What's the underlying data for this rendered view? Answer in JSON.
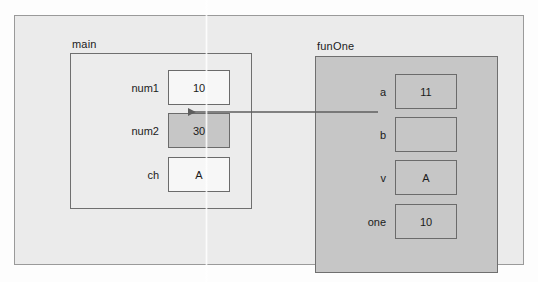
{
  "diagram": {
    "type": "memory-scope-diagram",
    "colors": {
      "page_background": "#fdfdfd",
      "outer_frame_fill": "#ebebeb",
      "outer_frame_border": "#9a9a9a",
      "main_scope_fill": "#ececec",
      "funone_scope_fill": "#c6c6c6",
      "box_border": "#6b6b6b",
      "box_white_fill": "#f7f7f7",
      "box_gray_fill": "#c6c6c6",
      "arrow_color": "#5e5e5e",
      "text": "#1b1b1b"
    },
    "scopes": [
      {
        "id": "main",
        "label": "main",
        "variables": [
          {
            "name": "num1",
            "value": "10",
            "fill": "white"
          },
          {
            "name": "num2",
            "value": "30",
            "fill": "gray"
          },
          {
            "name": "ch",
            "value": "A",
            "fill": "white"
          }
        ]
      },
      {
        "id": "funOne",
        "label": "funOne",
        "variables": [
          {
            "name": "a",
            "value": "11",
            "fill": "gray"
          },
          {
            "name": "b",
            "value": "",
            "fill": "gray"
          },
          {
            "name": "v",
            "value": "A",
            "fill": "gray"
          },
          {
            "name": "one",
            "value": "10",
            "fill": "gray"
          }
        ]
      }
    ],
    "arrows": [
      {
        "id": "b-to-num2",
        "from": "funOne.b",
        "to": "main.num2",
        "direction": "left",
        "description": "reference arrow from b pointing to num2"
      }
    ]
  }
}
